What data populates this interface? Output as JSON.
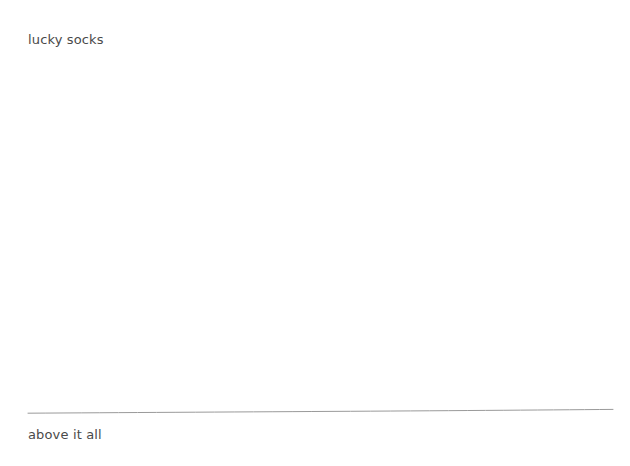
{
  "canvas": {
    "width": 630,
    "height": 466,
    "background_color": "#ffffff"
  },
  "content": {
    "top_caption": "lucky socks",
    "bottom_caption": "above it all"
  },
  "divider": {
    "name": "horizon-line",
    "color": "#9a9a9a",
    "stroke_width": 1,
    "start_x": 28,
    "start_y": 413,
    "end_x": 613,
    "end_y": 409
  },
  "text_style": {
    "color": "#4a4a4a",
    "font_size_px": 13
  }
}
